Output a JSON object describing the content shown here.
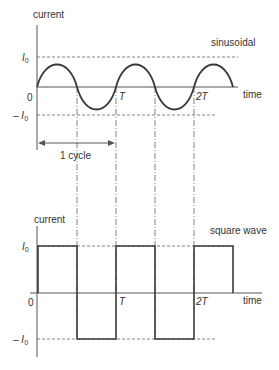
{
  "top_plot": {
    "y_axis_label": "current",
    "x_axis_label": "time",
    "wave_label": "sinusoidal",
    "origin_label": "0",
    "ticks": {
      "T": "T",
      "two_T": "2T"
    },
    "levels": {
      "pos": "I",
      "neg": "– I",
      "sub": "0"
    },
    "cycle_label": "1 cycle"
  },
  "bottom_plot": {
    "y_axis_label": "current",
    "x_axis_label": "time",
    "wave_label": "square wave",
    "origin_label": "0",
    "ticks": {
      "T": "T",
      "two_T": "2T"
    },
    "levels": {
      "pos": "I",
      "neg": "– I",
      "sub": "0"
    }
  },
  "colors": {
    "wave": "#3a3a3a",
    "axis": "#555555",
    "dashed": "#666666",
    "text": "#333333"
  }
}
